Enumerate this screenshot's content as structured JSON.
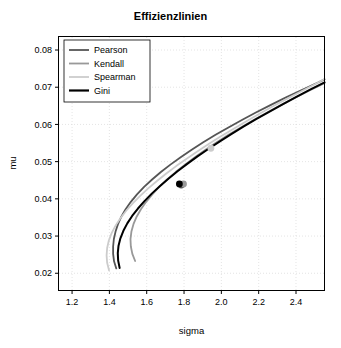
{
  "chart_data": {
    "type": "line",
    "title": "Effizienzlinien",
    "xlabel": "sigma",
    "ylabel": "mu",
    "xlim": [
      1.13,
      2.55
    ],
    "ylim": [
      0.0155,
      0.0835
    ],
    "xticks": [
      1.2,
      1.4,
      1.6,
      1.8,
      2.0,
      2.2,
      2.4
    ],
    "xticklabels": [
      "1.2",
      "1.4",
      "1.6",
      "1.8",
      "2.0",
      "2.2",
      "2.4"
    ],
    "yticks": [
      0.02,
      0.03,
      0.04,
      0.05,
      0.06,
      0.07,
      0.08
    ],
    "yticklabels": [
      "0.02",
      "0.03",
      "0.04",
      "0.05",
      "0.06",
      "0.07",
      "0.08"
    ],
    "grid": true,
    "legend_position": "top-left",
    "series": [
      {
        "name": "Pearson",
        "color": "#555555",
        "width": 1.8,
        "marker": {
          "x": 1.785,
          "y": 0.0437,
          "color": "#555555",
          "size": 3.4
        },
        "points": [
          [
            1.437,
            0.0213
          ],
          [
            1.425,
            0.0232
          ],
          [
            1.42,
            0.0252
          ],
          [
            1.42,
            0.0272
          ],
          [
            1.424,
            0.0292
          ],
          [
            1.433,
            0.0312
          ],
          [
            1.446,
            0.0332
          ],
          [
            1.464,
            0.0352
          ],
          [
            1.487,
            0.0372
          ],
          [
            1.515,
            0.0392
          ],
          [
            1.548,
            0.0412
          ],
          [
            1.586,
            0.0432
          ],
          [
            1.629,
            0.0452
          ],
          [
            1.676,
            0.0472
          ],
          [
            1.727,
            0.0492
          ],
          [
            1.782,
            0.0512
          ],
          [
            1.841,
            0.0532
          ],
          [
            1.903,
            0.0552
          ],
          [
            1.969,
            0.0572
          ],
          [
            2.038,
            0.0592
          ],
          [
            2.11,
            0.0612
          ],
          [
            2.185,
            0.0632
          ],
          [
            2.263,
            0.0652
          ],
          [
            2.344,
            0.0672
          ],
          [
            2.428,
            0.0692
          ],
          [
            2.515,
            0.0712
          ],
          [
            2.553,
            0.0721
          ]
        ]
      },
      {
        "name": "Kendall",
        "color": "#999999",
        "width": 1.8,
        "marker": {
          "x": 1.797,
          "y": 0.044,
          "color": "#999999",
          "size": 3.4
        },
        "points": [
          [
            1.538,
            0.0233
          ],
          [
            1.523,
            0.0252
          ],
          [
            1.515,
            0.0272
          ],
          [
            1.513,
            0.0292
          ],
          [
            1.518,
            0.0312
          ],
          [
            1.529,
            0.0332
          ],
          [
            1.546,
            0.0352
          ],
          [
            1.569,
            0.0372
          ],
          [
            1.597,
            0.0392
          ],
          [
            1.63,
            0.0412
          ],
          [
            1.667,
            0.0432
          ],
          [
            1.709,
            0.0452
          ],
          [
            1.755,
            0.0472
          ],
          [
            1.805,
            0.0492
          ],
          [
            1.858,
            0.0512
          ],
          [
            1.915,
            0.0532
          ],
          [
            1.975,
            0.0552
          ],
          [
            2.038,
            0.0572
          ],
          [
            2.104,
            0.0592
          ],
          [
            2.173,
            0.0612
          ],
          [
            2.245,
            0.0632
          ],
          [
            2.319,
            0.0652
          ],
          [
            2.396,
            0.0672
          ],
          [
            2.475,
            0.0692
          ],
          [
            2.553,
            0.0711
          ]
        ]
      },
      {
        "name": "Spearman",
        "color": "#cccccc",
        "width": 1.8,
        "marker": {
          "x": 1.944,
          "y": 0.0536,
          "color": "#cccccc",
          "size": 3.4
        },
        "points": [
          [
            1.398,
            0.0208
          ],
          [
            1.388,
            0.0228
          ],
          [
            1.385,
            0.0248
          ],
          [
            1.388,
            0.0268
          ],
          [
            1.397,
            0.0288
          ],
          [
            1.412,
            0.0308
          ],
          [
            1.433,
            0.0328
          ],
          [
            1.459,
            0.0348
          ],
          [
            1.49,
            0.0368
          ],
          [
            1.525,
            0.0388
          ],
          [
            1.565,
            0.0408
          ],
          [
            1.608,
            0.0428
          ],
          [
            1.655,
            0.0448
          ],
          [
            1.705,
            0.0468
          ],
          [
            1.758,
            0.0488
          ],
          [
            1.814,
            0.0508
          ],
          [
            1.873,
            0.0528
          ],
          [
            1.934,
            0.0548
          ],
          [
            1.998,
            0.0568
          ],
          [
            2.064,
            0.0588
          ],
          [
            2.132,
            0.0608
          ],
          [
            2.202,
            0.0628
          ],
          [
            2.274,
            0.0648
          ],
          [
            2.348,
            0.0668
          ],
          [
            2.424,
            0.0688
          ],
          [
            2.501,
            0.0708
          ],
          [
            2.553,
            0.0722
          ]
        ]
      },
      {
        "name": "Gini",
        "color": "#000000",
        "width": 2.0,
        "marker": {
          "x": 1.775,
          "y": 0.044,
          "color": "#000000",
          "size": 3.4
        },
        "points": [
          [
            1.455,
            0.0214
          ],
          [
            1.447,
            0.0234
          ],
          [
            1.445,
            0.0254
          ],
          [
            1.449,
            0.0274
          ],
          [
            1.459,
            0.0294
          ],
          [
            1.475,
            0.0314
          ],
          [
            1.496,
            0.0334
          ],
          [
            1.522,
            0.0354
          ],
          [
            1.553,
            0.0374
          ],
          [
            1.588,
            0.0394
          ],
          [
            1.627,
            0.0414
          ],
          [
            1.67,
            0.0434
          ],
          [
            1.716,
            0.0454
          ],
          [
            1.765,
            0.0474
          ],
          [
            1.817,
            0.0494
          ],
          [
            1.872,
            0.0514
          ],
          [
            1.93,
            0.0534
          ],
          [
            1.99,
            0.0554
          ],
          [
            2.053,
            0.0574
          ],
          [
            2.118,
            0.0594
          ],
          [
            2.186,
            0.0614
          ],
          [
            2.256,
            0.0634
          ],
          [
            2.328,
            0.0654
          ],
          [
            2.402,
            0.0674
          ],
          [
            2.478,
            0.0694
          ],
          [
            2.553,
            0.0713
          ]
        ]
      }
    ],
    "legend_entries": [
      {
        "label": "Pearson",
        "color": "#555555"
      },
      {
        "label": "Kendall",
        "color": "#999999"
      },
      {
        "label": "Spearman",
        "color": "#cccccc"
      },
      {
        "label": "Gini",
        "color": "#000000"
      }
    ]
  }
}
